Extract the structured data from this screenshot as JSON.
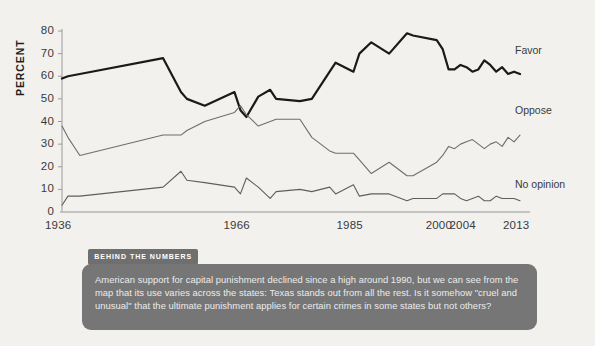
{
  "chart_data": {
    "type": "line",
    "title": "",
    "xlabel": "",
    "ylabel": "PERCENT",
    "ylim": [
      0,
      80
    ],
    "ytick_values": [
      0,
      10,
      20,
      30,
      40,
      50,
      60,
      70,
      80
    ],
    "xtick_labels": [
      "1936",
      "1966",
      "1985",
      "2000",
      "2004",
      "2013"
    ],
    "xtick_positions": [
      1936,
      1966,
      1985,
      2000,
      2004,
      2013
    ],
    "grid": false,
    "legend_position": "right-inline",
    "x": [
      1936,
      1937,
      1939,
      1953,
      1956,
      1957,
      1960,
      1965,
      1966,
      1967,
      1969,
      1971,
      1972,
      1976,
      1978,
      1981,
      1982,
      1985,
      1986,
      1988,
      1991,
      1994,
      1995,
      1999,
      2000,
      2001,
      2002,
      2003,
      2004,
      2005,
      2006,
      2007,
      2008,
      2009,
      2010,
      2011,
      2012,
      2013
    ],
    "series": [
      {
        "name": "Favor",
        "color": "#1a1a1a",
        "values": [
          59,
          60,
          61,
          68,
          53,
          50,
          47,
          53,
          45,
          42,
          51,
          54,
          50,
          49,
          50,
          62,
          66,
          62,
          70,
          75,
          70,
          79,
          78,
          76,
          72,
          63,
          63,
          65,
          64,
          62,
          63,
          67,
          65,
          62,
          64,
          61,
          62,
          61
        ]
      },
      {
        "name": "Oppose",
        "color": "#6e6e6e",
        "values": [
          38,
          33,
          25,
          34,
          34,
          36,
          40,
          44,
          47,
          43,
          38,
          40,
          41,
          41,
          33,
          27,
          26,
          26,
          23,
          17,
          22,
          16,
          16,
          22,
          25,
          29,
          28,
          30,
          31,
          32,
          30,
          28,
          30,
          31,
          29,
          33,
          31,
          34
        ]
      },
      {
        "name": "No opinion",
        "color": "#5e5e5e",
        "values": [
          3,
          7,
          7,
          11,
          18,
          14,
          13,
          11,
          8,
          15,
          11,
          6,
          9,
          10,
          9,
          11,
          8,
          12,
          7,
          8,
          8,
          5,
          6,
          6,
          8,
          8,
          8,
          6,
          5,
          6,
          7,
          5,
          5,
          7,
          6,
          6,
          6,
          5
        ]
      }
    ]
  },
  "axis": {
    "ylabel": "PERCENT"
  },
  "badge": {
    "label": "BEHIND THE NUMBERS"
  },
  "caption": {
    "text": "American support for capital punishment declined since a high around 1990, but we can see from the map that its use varies across the states: Texas stands out from all the rest. Is it somehow \"cruel and unusual\" that the ultimate punishment applies for certain crimes in some states but not others?"
  },
  "colors": {
    "background": "#f2f1ee",
    "favor": "#1a1a1a",
    "oppose": "#6e6e6e",
    "no_opinion": "#5e5e5e",
    "caption_box": "#767676",
    "badge": "#6f6f6f"
  }
}
